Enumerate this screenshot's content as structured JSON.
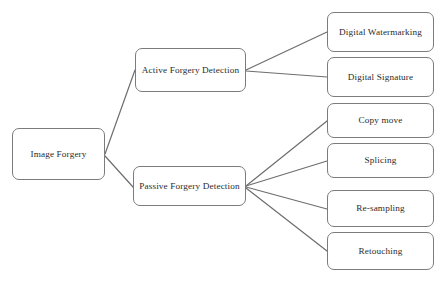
{
  "diagram": {
    "type": "tree",
    "style": {
      "box_border_color": "#7c7c7c",
      "box_fill_color": "#ffffff",
      "connector_color": "#6e6e6e",
      "text_color": "#2b2b2b",
      "background_color": "#ffffff"
    },
    "nodes": {
      "root": {
        "label": "Image Forgery"
      },
      "active": {
        "label": "Active Forgery Detection"
      },
      "passive": {
        "label": "Passive Forgery Detection"
      },
      "watermarking": {
        "label": "Digital Watermarking"
      },
      "signature": {
        "label": "Digital Signature"
      },
      "copymove": {
        "label": "Copy move"
      },
      "splicing": {
        "label": "Splicing"
      },
      "resampling": {
        "label": "Re-sampling"
      },
      "retouching": {
        "label": "Retouching"
      }
    },
    "edges": [
      {
        "from": "root",
        "to": "active"
      },
      {
        "from": "root",
        "to": "passive"
      },
      {
        "from": "active",
        "to": "watermarking"
      },
      {
        "from": "active",
        "to": "signature"
      },
      {
        "from": "passive",
        "to": "copymove"
      },
      {
        "from": "passive",
        "to": "splicing"
      },
      {
        "from": "passive",
        "to": "resampling"
      },
      {
        "from": "passive",
        "to": "retouching"
      }
    ]
  }
}
